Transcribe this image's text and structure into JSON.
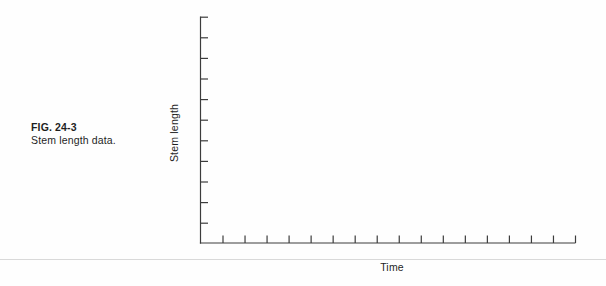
{
  "figure": {
    "caption_title": "FIG. 24-3",
    "caption_text": "Stem length data.",
    "x_axis_label": "Time",
    "y_axis_label": "Stem length"
  },
  "chart_data": {
    "type": "line",
    "title": "",
    "xlabel": "Time",
    "ylabel": "Stem length",
    "series": [],
    "x_tick_labels": [],
    "y_tick_labels": [],
    "x_tick_count": 17,
    "y_tick_count": 11,
    "axes_empty": true,
    "note": "Blank axes for plotting stem length versus time; no data points, gridlines, or numeric tick labels are shown."
  },
  "colors": {
    "axis": "#3c3c3c",
    "text": "#1e1e1e",
    "rule": "#d9d9d9",
    "background": "#fefefe"
  }
}
